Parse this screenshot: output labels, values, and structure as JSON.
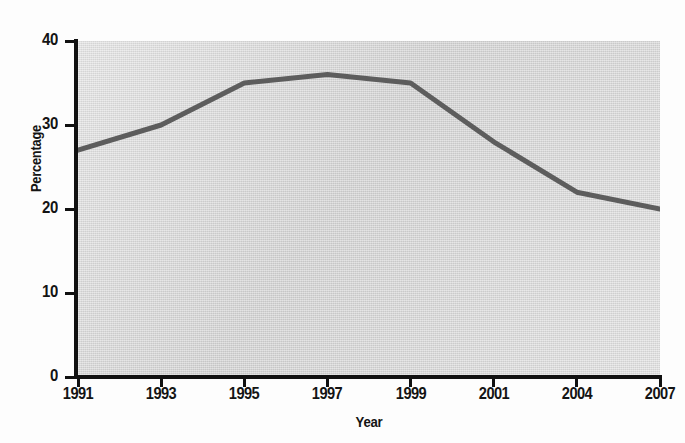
{
  "chart_data": {
    "type": "line",
    "title": "",
    "subtitle": "",
    "xlabel": "Year",
    "ylabel": "Percentage",
    "categories": [
      "1991",
      "1993",
      "1995",
      "1997",
      "1999",
      "2001",
      "2004",
      "2007"
    ],
    "series": [
      {
        "name": "Percentage",
        "values": [
          27,
          30,
          35,
          36,
          35,
          28,
          22,
          20
        ],
        "color": "#5d5d5d"
      }
    ],
    "values": [
      27,
      30,
      35,
      36,
      35,
      28,
      22,
      20
    ],
    "ylim": [
      0,
      40
    ],
    "y_ticks": [
      0,
      10,
      20,
      30,
      40
    ],
    "y_tick_labels": [
      "0",
      "10",
      "20",
      "30",
      "40"
    ],
    "x_tick_labels": [
      "1991",
      "1993",
      "1995",
      "1997",
      "1999",
      "2001",
      "2004",
      "2007"
    ],
    "grid": false,
    "legend": false,
    "legend_position": "none",
    "annotations": [],
    "plot_background_color": "#d9d9d9",
    "axis_color": "#111111",
    "line_color": "#5d5d5d",
    "line_width": 4
  },
  "axes": {
    "y_title": "Percentage",
    "x_title": "Year",
    "y_ticks": [
      {
        "label": "40",
        "value": 40
      },
      {
        "label": "30",
        "value": 30
      },
      {
        "label": "20",
        "value": 20
      },
      {
        "label": "10",
        "value": 10
      },
      {
        "label": "0",
        "value": 0
      }
    ],
    "x_ticks": [
      {
        "label": "1991"
      },
      {
        "label": "1993"
      },
      {
        "label": "1995"
      },
      {
        "label": "1997"
      },
      {
        "label": "1999"
      },
      {
        "label": "2001"
      },
      {
        "label": "2004"
      },
      {
        "label": "2007"
      }
    ]
  }
}
